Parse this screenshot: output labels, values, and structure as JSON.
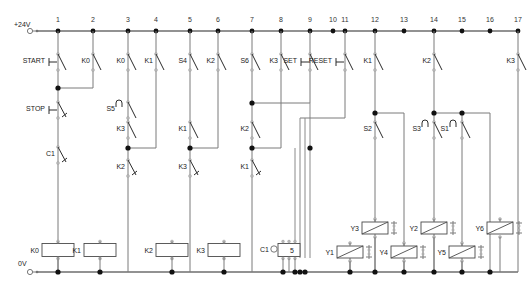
{
  "diagram": {
    "supply_top_label": "+24V",
    "supply_bottom_label": "0V",
    "line_color": "#7a7a7a",
    "rail_color": "#6e6e6e",
    "contact_color": "#2b2b2b",
    "background": "#ffffff"
  },
  "rung_numbers": [
    {
      "n": "1",
      "x": 58
    },
    {
      "n": "2",
      "x": 93
    },
    {
      "n": "3",
      "x": 128
    },
    {
      "n": "4",
      "x": 156
    },
    {
      "n": "5",
      "x": 190
    },
    {
      "n": "6",
      "x": 218
    },
    {
      "n": "7",
      "x": 252
    },
    {
      "n": "8",
      "x": 281
    },
    {
      "n": "9",
      "x": 310
    },
    {
      "n": "10",
      "x": 333
    },
    {
      "n": "11",
      "x": 345
    },
    {
      "n": "12",
      "x": 375
    },
    {
      "n": "13",
      "x": 404
    },
    {
      "n": "14",
      "x": 434
    },
    {
      "n": "15",
      "x": 462
    },
    {
      "n": "16",
      "x": 490
    },
    {
      "n": "17",
      "x": 518
    }
  ],
  "contacts": [
    {
      "id": "start",
      "label": "START",
      "type": "no-pushbutton",
      "x": 58,
      "y": 62
    },
    {
      "id": "k0-seal",
      "label": "K0",
      "type": "no",
      "x": 93,
      "y": 62
    },
    {
      "id": "k0-r3",
      "label": "K0",
      "type": "no",
      "x": 128,
      "y": 62
    },
    {
      "id": "k1-r4",
      "label": "K1",
      "type": "no",
      "x": 156,
      "y": 62
    },
    {
      "id": "s4",
      "label": "S4",
      "type": "no",
      "x": 190,
      "y": 62
    },
    {
      "id": "k2-r6",
      "label": "K2",
      "type": "no",
      "x": 218,
      "y": 62
    },
    {
      "id": "s6",
      "label": "S6",
      "type": "no",
      "x": 252,
      "y": 62
    },
    {
      "id": "k3-r8",
      "label": "K3",
      "type": "no",
      "x": 281,
      "y": 62
    },
    {
      "id": "set",
      "label": "SET",
      "type": "no-pushbutton",
      "x": 310,
      "y": 62
    },
    {
      "id": "reset",
      "label": "RESET",
      "type": "no-pushbutton",
      "x": 345,
      "y": 62
    },
    {
      "id": "k1-r12",
      "label": "K1",
      "type": "no",
      "x": 375,
      "y": 62
    },
    {
      "id": "k2-r14",
      "label": "K2",
      "type": "no",
      "x": 434,
      "y": 62
    },
    {
      "id": "k3-r17",
      "label": "K3",
      "type": "no",
      "x": 518,
      "y": 62
    },
    {
      "id": "stop",
      "label": "STOP",
      "type": "nc-pushbutton",
      "x": 58,
      "y": 110
    },
    {
      "id": "s5",
      "label": "S5",
      "type": "no-limit",
      "x": 128,
      "y": 110
    },
    {
      "id": "k3-r3b",
      "label": "K3",
      "type": "no",
      "x": 128,
      "y": 130
    },
    {
      "id": "k1-r5b",
      "label": "K1",
      "type": "no",
      "x": 190,
      "y": 130
    },
    {
      "id": "k2-r7b",
      "label": "K2",
      "type": "no",
      "x": 252,
      "y": 130
    },
    {
      "id": "c1-nc",
      "label": "C1",
      "type": "nc",
      "x": 58,
      "y": 155
    },
    {
      "id": "k2-r3c",
      "label": "K2",
      "type": "nc",
      "x": 128,
      "y": 168
    },
    {
      "id": "k3-r5c",
      "label": "K3",
      "type": "nc",
      "x": 190,
      "y": 168
    },
    {
      "id": "k1-r7c",
      "label": "K1",
      "type": "nc",
      "x": 252,
      "y": 168
    },
    {
      "id": "s2",
      "label": "S2",
      "type": "no",
      "x": 375,
      "y": 130
    },
    {
      "id": "s3",
      "label": "S3",
      "type": "no-limit",
      "x": 434,
      "y": 130
    },
    {
      "id": "s1",
      "label": "S1",
      "type": "no-limit",
      "x": 462,
      "y": 130
    }
  ],
  "relay_coils": [
    {
      "id": "k0",
      "label": "K0",
      "x": 58,
      "y": 250
    },
    {
      "id": "k1",
      "label": "K1",
      "x": 100,
      "y": 250
    },
    {
      "id": "k2",
      "label": "K2",
      "x": 172,
      "y": 250
    },
    {
      "id": "k3",
      "label": "K3",
      "x": 224,
      "y": 250
    }
  ],
  "counter": {
    "id": "c1",
    "label": "C1",
    "value": "5",
    "x": 289,
    "y": 250
  },
  "valve_coils": [
    {
      "id": "y1",
      "label": "Y1",
      "x": 350,
      "y": 252,
      "row": "lower"
    },
    {
      "id": "y3",
      "label": "Y3",
      "x": 375,
      "y": 228,
      "row": "upper"
    },
    {
      "id": "y4",
      "label": "Y4",
      "x": 404,
      "y": 252,
      "row": "lower"
    },
    {
      "id": "y2",
      "label": "Y2",
      "x": 434,
      "y": 228,
      "row": "upper"
    },
    {
      "id": "y5",
      "label": "Y5",
      "x": 462,
      "y": 252,
      "row": "lower"
    },
    {
      "id": "y6",
      "label": "Y6",
      "x": 500,
      "y": 228,
      "row": "upper"
    }
  ],
  "legend": {
    "start_stop": [
      "START",
      "STOP",
      "SET",
      "RESET"
    ],
    "sensors": [
      "S1",
      "S2",
      "S3",
      "S4",
      "S5",
      "S6"
    ],
    "relays": [
      "K0",
      "K1",
      "K2",
      "K3"
    ],
    "solenoids": [
      "Y1",
      "Y2",
      "Y3",
      "Y4",
      "Y5",
      "Y6"
    ],
    "counter_preset": "5"
  }
}
